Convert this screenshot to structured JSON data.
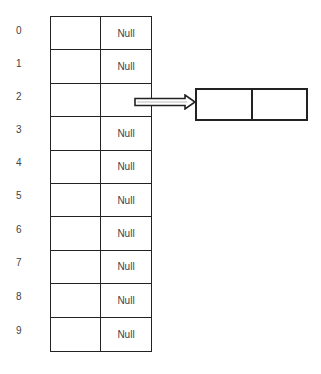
{
  "diagram": {
    "type": "hash-table-chaining",
    "slots": [
      {
        "index": "0",
        "pointer": "Null"
      },
      {
        "index": "1",
        "pointer": "Null"
      },
      {
        "index": "2",
        "pointer": ""
      },
      {
        "index": "3",
        "pointer": "Null"
      },
      {
        "index": "4",
        "pointer": "Null"
      },
      {
        "index": "5",
        "pointer": "Null"
      },
      {
        "index": "6",
        "pointer": "Null"
      },
      {
        "index": "7",
        "pointer": "Null"
      },
      {
        "index": "8",
        "pointer": "Null"
      },
      {
        "index": "9",
        "pointer": "Null"
      }
    ],
    "chained_node": {
      "from_slot": "2",
      "fields": [
        "",
        ""
      ]
    },
    "colors": {
      "line": "#222222",
      "text": "#444444",
      "background": "#ffffff"
    }
  }
}
